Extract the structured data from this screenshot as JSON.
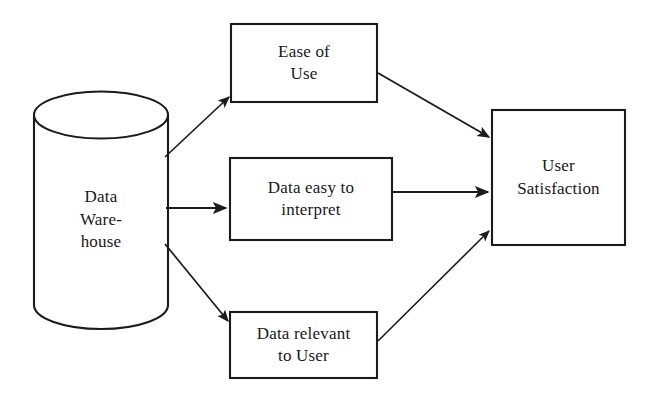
{
  "diagram": {
    "stroke_color": "#1b1b1d",
    "fill_color": "#ffffff",
    "background_color": "#ffffff",
    "nodes": [
      {
        "id": "data-warehouse",
        "shape": "cylinder",
        "lines": [
          "Data",
          "Ware-",
          "house"
        ],
        "x": 34,
        "y": 92,
        "width": 134,
        "height": 236
      },
      {
        "id": "ease-of-use",
        "shape": "rectangle",
        "lines": [
          "Ease of",
          "Use"
        ],
        "x": 231,
        "y": 24,
        "width": 146,
        "height": 78
      },
      {
        "id": "data-easy-to-interpret",
        "shape": "rectangle",
        "lines": [
          "Data easy to",
          "interpret"
        ],
        "x": 230,
        "y": 158,
        "width": 162,
        "height": 82
      },
      {
        "id": "data-relevant-to-user",
        "shape": "rectangle",
        "lines": [
          "Data relevant",
          "to User"
        ],
        "x": 230,
        "y": 312,
        "width": 147,
        "height": 66
      },
      {
        "id": "user-satisfaction",
        "shape": "rectangle",
        "lines": [
          "User",
          "Satisfaction"
        ],
        "x": 492,
        "y": 110,
        "width": 133,
        "height": 135
      }
    ],
    "edges": [
      {
        "id": "warehouse-to-ease-of-use",
        "from": "data-warehouse",
        "to": "ease-of-use",
        "x1": 165,
        "y1": 157,
        "x2": 229,
        "y2": 97
      },
      {
        "id": "warehouse-to-data-easy",
        "from": "data-warehouse",
        "to": "data-easy-to-interpret",
        "x1": 166,
        "y1": 208,
        "x2": 228,
        "y2": 208
      },
      {
        "id": "warehouse-to-data-relevant",
        "from": "data-warehouse",
        "to": "data-relevant-to-user",
        "x1": 165,
        "y1": 244,
        "x2": 228,
        "y2": 322
      },
      {
        "id": "ease-of-use-to-satisfaction",
        "from": "ease-of-use",
        "to": "user-satisfaction",
        "x1": 378,
        "y1": 73,
        "x2": 490,
        "y2": 138
      },
      {
        "id": "data-easy-to-satisfaction",
        "from": "data-easy-to-interpret",
        "to": "user-satisfaction",
        "x1": 393,
        "y1": 192,
        "x2": 490,
        "y2": 192
      },
      {
        "id": "data-relevant-to-satisfaction",
        "from": "data-relevant-to-user",
        "to": "user-satisfaction",
        "x1": 378,
        "y1": 341,
        "x2": 490,
        "y2": 230
      }
    ]
  }
}
